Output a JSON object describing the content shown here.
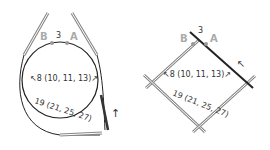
{
  "left_diagram": {
    "type": "circular-needle",
    "marker_b": "B",
    "marker_a": "A",
    "gap_label": "3",
    "width_label": "8 (10, 11, 13)",
    "length_label": "19 (21, 25, 27)"
  },
  "right_diagram": {
    "type": "double-pointed-needles",
    "marker_b": "B",
    "marker_a": "A",
    "gap_label": "3",
    "width_label": "8 (10, 11, 13)",
    "length_label": "19 (21, 25, 27)"
  },
  "colors": {
    "line": "#222222",
    "needle": "#888888",
    "marker_text": "#aaaaaa"
  }
}
